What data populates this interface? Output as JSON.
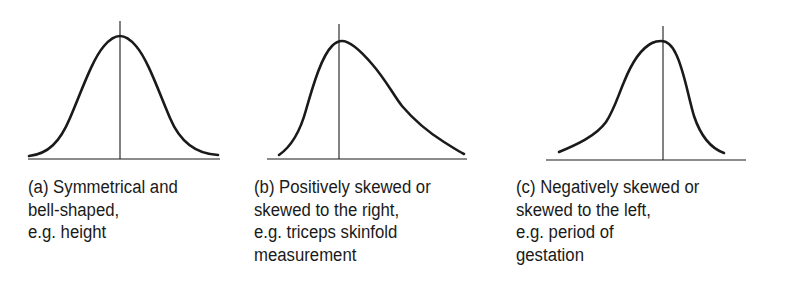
{
  "panels": [
    {
      "id": "a",
      "shape": "symmetrical",
      "caption_lines": [
        "(a) Symmetrical and",
        "bell-shaped,",
        "e.g. height"
      ]
    },
    {
      "id": "b",
      "shape": "positively-skewed",
      "caption_lines": [
        "(b) Positively skewed or",
        "skewed to the right,",
        "e.g. triceps skinfold",
        "measurement"
      ]
    },
    {
      "id": "c",
      "shape": "negatively-skewed",
      "caption_lines": [
        "(c) Negatively skewed or",
        "skewed to the left,",
        "e.g. period of",
        "gestation"
      ]
    }
  ],
  "colors": {
    "ink": "#1a1a1a",
    "background": "#ffffff"
  }
}
